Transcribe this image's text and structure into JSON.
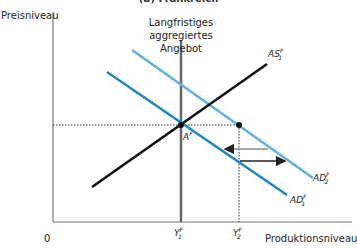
{
  "title": "(b) Frankreich",
  "axes": {
    "y_label": "Preisniveau",
    "x_label": "Produktionsniveau",
    "origin": "0"
  },
  "lras_label": "Langfristiges aggregiertes Angebot",
  "curves": {
    "as": {
      "name": "AS",
      "sub": "1",
      "sup": "F",
      "color": "#111111"
    },
    "ad1": {
      "name": "AD",
      "sub": "1",
      "sup": "F",
      "color": "#1f86c8"
    },
    "ad2": {
      "name": "AD",
      "sub": "2",
      "sup": "F",
      "color": "#5fb3e3"
    }
  },
  "points": {
    "a": {
      "name": "A",
      "sup": "F"
    }
  },
  "x_ticks": [
    {
      "name": "Y",
      "sub": "1",
      "sup": "F"
    },
    {
      "name": "Y",
      "sub": "2",
      "sup": "F"
    }
  ],
  "colors": {
    "axis": "#777777",
    "lras": "#666666",
    "dotted": "#333333",
    "arrow_left": "#888888",
    "arrow_right": "#222222"
  }
}
